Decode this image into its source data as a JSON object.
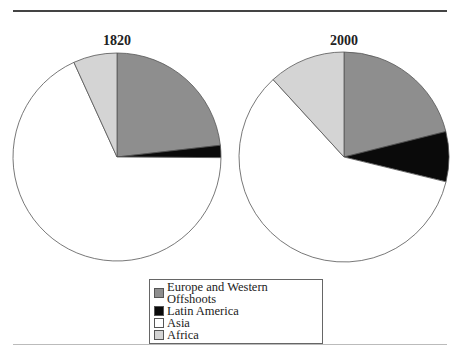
{
  "chart_data": {
    "type": "pie",
    "title": "",
    "legend_position": "bottom",
    "categories": [
      "Europe and Western Offshoots",
      "Latin America",
      "Asia",
      "Africa"
    ],
    "colors": [
      "#8e8e8e",
      "#0a0a0a",
      "#ffffff",
      "#d4d4d4"
    ],
    "unit": "percent (estimated)",
    "pies": [
      {
        "title": "1820",
        "values": [
          23.2,
          1.9,
          68.1,
          6.8
        ]
      },
      {
        "title": "2000",
        "values": [
          21.1,
          7.7,
          59.4,
          11.8
        ]
      }
    ]
  },
  "legend": {
    "items": [
      {
        "label": "Europe and Western Offshoots",
        "color": "#8e8e8e"
      },
      {
        "label": "Latin America",
        "color": "#0a0a0a"
      },
      {
        "label": "Asia",
        "color": "#ffffff"
      },
      {
        "label": "Africa",
        "color": "#d4d4d4"
      }
    ]
  }
}
